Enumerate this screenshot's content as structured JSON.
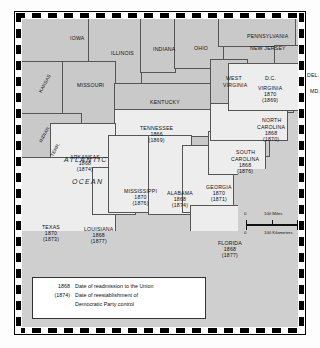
{
  "figure": {
    "name": "reconstruction-map",
    "ocean_labels": [
      "ATLANTIC",
      "OCEAN"
    ]
  },
  "scale": {
    "miles_zero": "0",
    "miles_label": "100 Miles",
    "km_zero": "0",
    "km_label": "100 Kilometers"
  },
  "legend": {
    "rows": [
      {
        "key": "1868",
        "text": "Date of readmission to the Union"
      },
      {
        "key": "(1874)",
        "text": "Date of reestablishment of"
      },
      {
        "key": "",
        "text": "Democratic Party control"
      }
    ]
  },
  "colors": {
    "confederate_fill": "#ededed",
    "other_state_fill": "#c9c9c9",
    "ocean_fill": "#cfcfcf",
    "border": "#555555",
    "frame": "#000000"
  },
  "states": [
    {
      "id": "iowa",
      "name": "IOWA",
      "readmitted": "",
      "democratic": "",
      "confederate": false,
      "x": 48,
      "y": 17,
      "rotated": false
    },
    {
      "id": "illinois",
      "name": "ILLINOIS",
      "readmitted": "",
      "democratic": "",
      "confederate": false,
      "x": 89,
      "y": 32,
      "rotated": false
    },
    {
      "id": "indiana",
      "name": "INDIANA",
      "readmitted": "",
      "democratic": "",
      "confederate": false,
      "x": 131,
      "y": 28,
      "rotated": false
    },
    {
      "id": "ohio",
      "name": "OHIO",
      "readmitted": "",
      "democratic": "",
      "confederate": false,
      "x": 172,
      "y": 27,
      "rotated": false
    },
    {
      "id": "pennsylvania",
      "name": "PENNSYLVANIA",
      "readmitted": "",
      "democratic": "",
      "confederate": false,
      "x": 225,
      "y": 15,
      "rotated": false
    },
    {
      "id": "new-jersey",
      "name": "NEW JERSEY",
      "readmitted": "",
      "democratic": "",
      "confederate": false,
      "x": 228,
      "y": 27,
      "rotated": false
    },
    {
      "id": "delaware",
      "name": "DEL.",
      "readmitted": "",
      "democratic": "",
      "confederate": false,
      "x": 285,
      "y": 54,
      "rotated": false
    },
    {
      "id": "maryland",
      "name": "MD.",
      "readmitted": "",
      "democratic": "",
      "confederate": false,
      "x": 288,
      "y": 70,
      "rotated": false
    },
    {
      "id": "missouri",
      "name": "MISSOURI",
      "readmitted": "",
      "democratic": "",
      "confederate": false,
      "x": 55,
      "y": 64,
      "rotated": false
    },
    {
      "id": "kansas",
      "name": "KANSAS",
      "readmitted": "",
      "democratic": "",
      "confederate": false,
      "x": 13,
      "y": 62,
      "rotated": true
    },
    {
      "id": "indian-terr-1",
      "name": "INDIAN",
      "readmitted": "",
      "democratic": "",
      "confederate": false,
      "x": 14,
      "y": 113,
      "rotated": true
    },
    {
      "id": "indian-terr-2",
      "name": "TERR.",
      "readmitted": "",
      "democratic": "",
      "confederate": false,
      "x": 26,
      "y": 128,
      "rotated": true
    },
    {
      "id": "kentucky",
      "name": "KENTUCKY",
      "readmitted": "",
      "democratic": "",
      "confederate": false,
      "x": 128,
      "y": 81,
      "rotated": false
    },
    {
      "id": "west-virginia",
      "name": "WEST",
      "readmitted": "",
      "democratic": "",
      "confederate": false,
      "x": 204,
      "y": 57,
      "rotated": false
    },
    {
      "id": "west-virginia2",
      "name": "VIRGINIA",
      "readmitted": "",
      "democratic": "",
      "confederate": false,
      "x": 201,
      "y": 64,
      "rotated": false
    },
    {
      "id": "dc",
      "name": "D.C.",
      "readmitted": "",
      "democratic": "",
      "confederate": false,
      "x": 243,
      "y": 57,
      "rotated": false
    },
    {
      "id": "virginia",
      "name": "VIRGINIA",
      "readmitted": "1870",
      "democratic": "(1869)",
      "confederate": true,
      "x": 236,
      "y": 67,
      "rotated": false
    },
    {
      "id": "north-carolina",
      "name": "NORTH",
      "readmitted": "",
      "democratic": "",
      "confederate": true,
      "x": 240,
      "y": 99,
      "rotated": false
    },
    {
      "id": "north-carolina2",
      "name": "CAROLINA",
      "readmitted": "1868",
      "democratic": "(1870)",
      "confederate": true,
      "x": 235,
      "y": 106,
      "rotated": false
    },
    {
      "id": "south-carolina",
      "name": "SOUTH",
      "readmitted": "",
      "democratic": "",
      "confederate": true,
      "x": 214,
      "y": 131,
      "rotated": false
    },
    {
      "id": "south-carolina2",
      "name": "CAROLINA",
      "readmitted": "1868",
      "democratic": "(1876)",
      "confederate": true,
      "x": 209,
      "y": 138,
      "rotated": false
    },
    {
      "id": "tennessee",
      "name": "TENNESSEE",
      "readmitted": "1866",
      "democratic": "(1869)",
      "confederate": true,
      "x": 118,
      "y": 107,
      "rotated": false
    },
    {
      "id": "arkansas",
      "name": "ARKANSAS",
      "readmitted": "1868",
      "democratic": "(1874)",
      "confederate": true,
      "x": 48,
      "y": 136,
      "rotated": false
    },
    {
      "id": "mississippi",
      "name": "MISSISSIPPI",
      "readmitted": "1870",
      "democratic": "(1876)",
      "confederate": true,
      "x": 102,
      "y": 170,
      "rotated": false
    },
    {
      "id": "alabama",
      "name": "ALABAMA",
      "readmitted": "1868",
      "democratic": "(1874)",
      "confederate": true,
      "x": 145,
      "y": 172,
      "rotated": false
    },
    {
      "id": "georgia",
      "name": "GEORGIA",
      "readmitted": "1870",
      "democratic": "(1871)",
      "confederate": true,
      "x": 184,
      "y": 166,
      "rotated": false
    },
    {
      "id": "louisiana",
      "name": "LOUISIANA",
      "readmitted": "1868",
      "democratic": "(1877)",
      "confederate": true,
      "x": 62,
      "y": 208,
      "rotated": false
    },
    {
      "id": "texas",
      "name": "TEXAS",
      "readmitted": "1870",
      "democratic": "(1873)",
      "confederate": true,
      "x": 20,
      "y": 206,
      "rotated": false
    },
    {
      "id": "florida",
      "name": "FLORIDA",
      "readmitted": "1868",
      "democratic": "(1877)",
      "confederate": true,
      "x": 196,
      "y": 222,
      "rotated": false
    }
  ]
}
